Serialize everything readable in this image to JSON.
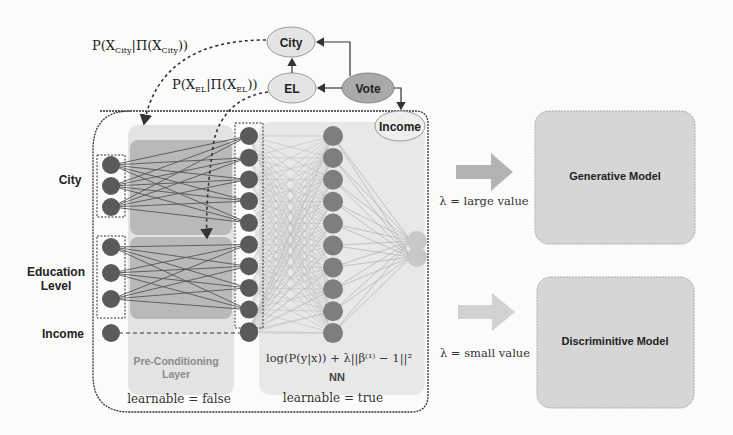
{
  "bayes_net": {
    "nodes": [
      {
        "id": "city",
        "label": "City"
      },
      {
        "id": "el",
        "label": "EL"
      },
      {
        "id": "vote",
        "label": "Vote"
      },
      {
        "id": "income",
        "label": "Income"
      }
    ],
    "edges": [
      [
        "vote",
        "city"
      ],
      [
        "vote",
        "el"
      ],
      [
        "el",
        "city"
      ],
      [
        "vote",
        "income"
      ]
    ],
    "formula_city": "P(X_City | Π(X_City))",
    "formula_el": "P(X_EL | Π(X_EL))",
    "formula_city_main": "P(X",
    "formula_city_sub": "City",
    "formula_city_mid": "|Π(X",
    "formula_city_sub2": "City",
    "formula_city_end": "))",
    "formula_el_main": "P(X",
    "formula_el_sub": "EL",
    "formula_el_mid": "|Π(X",
    "formula_el_sub2": "EL",
    "formula_el_end": "))"
  },
  "inputs": {
    "city_label": "City",
    "education_label_1": "Education",
    "education_label_2": "Level",
    "income_label": "Income",
    "city_nodes": 3,
    "education_nodes": 3,
    "income_nodes": 1
  },
  "preconditioning": {
    "title_1": "Pre-Conditioning",
    "title_2": "Layer",
    "learnable": "learnable = false",
    "output_nodes": 10
  },
  "nn": {
    "title": "NN",
    "loss": "log(P(y|x)) + λ||β⁽¹⁾ − 1||²",
    "learnable": "learnable = true",
    "hidden_nodes": 10,
    "output_nodes": 2
  },
  "outcomes": [
    {
      "lambda_label": "λ = large value",
      "model": "Generative Model"
    },
    {
      "lambda_label": "λ = small value",
      "model": "Discriminitive Model"
    }
  ],
  "colors": {
    "dark_node": "#5a5a5a",
    "hidden_node": "#7e7e7e",
    "output_node": "#c8c8c8",
    "panel_light": "#e3e3e3",
    "panel_dark": "#b9b9b9",
    "vote_fill": "#a9a9a9",
    "ellipse_fill": "#e4e4e4",
    "model_box": "#d6d6d6",
    "arrow_large": "#b3b3b3",
    "arrow_small": "#d2d2d2"
  }
}
